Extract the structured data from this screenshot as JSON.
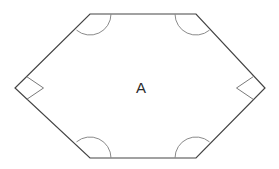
{
  "figure": {
    "canvas": {
      "width": 279,
      "height": 169,
      "background": "#ffffff"
    },
    "shape": {
      "name": "hexagon",
      "fill": "#ffffff",
      "stroke": "#444444",
      "stroke_width": 1.2,
      "vertices": [
        {
          "name": "top-left",
          "x": 90,
          "y": 14
        },
        {
          "name": "top-right",
          "x": 196,
          "y": 14
        },
        {
          "name": "right",
          "x": 265,
          "y": 88
        },
        {
          "name": "bottom-right",
          "x": 196,
          "y": 158
        },
        {
          "name": "bottom-left",
          "x": 90,
          "y": 158
        },
        {
          "name": "left",
          "x": 15,
          "y": 88
        }
      ]
    },
    "angle_marks": {
      "arc": {
        "stroke": "#8a8a8a",
        "stroke_width": 1,
        "radius": 21,
        "items": [
          {
            "name": "arc-top-left",
            "vertex": "top-left",
            "path": "M 111 14 A 21 21 0 0 1 76.5 30.1"
          },
          {
            "name": "arc-top-right",
            "vertex": "top-right",
            "path": "M 209.5 30.1 A 21 21 0 0 1 175 14"
          },
          {
            "name": "arc-bottom-left",
            "vertex": "bottom-left",
            "path": "M 76.5 141.9 A 21 21 0 0 1 111 158"
          },
          {
            "name": "arc-bottom-right",
            "vertex": "bottom-right",
            "path": "M 175 158 A 21 21 0 0 1 209.5 141.9"
          }
        ]
      },
      "right_angle": {
        "stroke": "#7a7a7a",
        "stroke_width": 1,
        "size": 17,
        "items": [
          {
            "name": "right-angle-left",
            "vertex": "left",
            "path": "M 26.8 76.7 L 43.5 88 L 26.8 99.3"
          },
          {
            "name": "right-angle-right",
            "vertex": "right",
            "path": "M 253.2 76.7 L 236.5 88 L 253.2 99.3"
          }
        ]
      }
    },
    "labels": [
      {
        "name": "region-label-a",
        "text": "A",
        "x": 141,
        "y": 89,
        "color": "#2b2b2b",
        "font_size": 15
      }
    ]
  }
}
